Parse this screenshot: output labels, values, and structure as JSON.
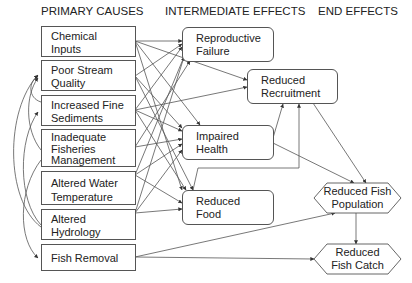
{
  "headers": {
    "primary": "PRIMARY CAUSES",
    "intermediate": "INTERMEDIATE EFFECTS",
    "end": "END EFFECTS"
  },
  "primary_causes": [
    {
      "id": "chem",
      "lines": [
        "Chemical",
        "Inputs"
      ]
    },
    {
      "id": "psq",
      "lines": [
        "Poor Stream",
        "Quality"
      ]
    },
    {
      "id": "ifs",
      "lines": [
        "Increased Fine",
        "Sediments"
      ]
    },
    {
      "id": "ifm",
      "lines": [
        "Inadequate",
        "Fisheries",
        "Management"
      ]
    },
    {
      "id": "awt",
      "lines": [
        "Altered Water",
        "Temperature"
      ]
    },
    {
      "id": "ah",
      "lines": [
        "Altered",
        "Hydrology"
      ]
    },
    {
      "id": "fr",
      "lines": [
        "Fish Removal"
      ]
    }
  ],
  "intermediate_effects": [
    {
      "id": "rf",
      "lines": [
        "Reproductive",
        "Failure"
      ]
    },
    {
      "id": "rr",
      "lines": [
        "Reduced",
        "Recruitment"
      ]
    },
    {
      "id": "ih",
      "lines": [
        "Impaired",
        "Health"
      ]
    },
    {
      "id": "rfood",
      "lines": [
        "Reduced",
        "Food"
      ]
    }
  ],
  "end_effects": [
    {
      "id": "rfp",
      "lines": [
        "Reduced Fish",
        "Population"
      ]
    },
    {
      "id": "rfc",
      "lines": [
        "Reduced",
        "Fish Catch"
      ]
    }
  ],
  "edges": [
    [
      "chem",
      "rf"
    ],
    [
      "chem",
      "rr"
    ],
    [
      "chem",
      "ih"
    ],
    [
      "chem",
      "rfood"
    ],
    [
      "psq",
      "rf"
    ],
    [
      "psq",
      "ih"
    ],
    [
      "psq",
      "rfood"
    ],
    [
      "ifs",
      "rf"
    ],
    [
      "ifs",
      "rr"
    ],
    [
      "ifs",
      "ih"
    ],
    [
      "ifs",
      "rfood"
    ],
    [
      "ifm",
      "ih"
    ],
    [
      "ifm",
      "rf"
    ],
    [
      "awt",
      "rf"
    ],
    [
      "awt",
      "ih"
    ],
    [
      "awt",
      "rfood"
    ],
    [
      "ah",
      "rf"
    ],
    [
      "ah",
      "ih"
    ],
    [
      "ah",
      "rfood"
    ],
    [
      "fr",
      "rfp"
    ],
    [
      "fr",
      "rfc"
    ],
    [
      "ih",
      "rr"
    ],
    [
      "ih",
      "rfp"
    ],
    [
      "rfood",
      "rr"
    ],
    [
      "rr",
      "rfp"
    ],
    [
      "rfp",
      "rfc"
    ],
    [
      "ah",
      "psq"
    ],
    [
      "ah",
      "ifs"
    ],
    [
      "ah",
      "fr"
    ],
    [
      "ifm",
      "psq"
    ],
    [
      "ifs",
      "psq"
    ]
  ],
  "colors": {
    "line": "#444444",
    "border": "#555555",
    "text": "#222222"
  }
}
